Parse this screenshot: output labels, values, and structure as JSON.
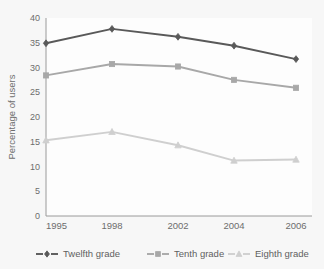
{
  "chart_data": {
    "type": "line",
    "title": "",
    "xlabel": "",
    "ylabel": "Percentage of users",
    "categories": [
      "1995",
      "1998",
      "2002",
      "2004",
      "2006"
    ],
    "x_tick_labels": [
      "1995",
      "1998",
      "2002",
      "2004",
      "2006"
    ],
    "y_tick_labels": [
      "0",
      "5",
      "10",
      "15",
      "20",
      "25",
      "30",
      "35",
      "40"
    ],
    "y_ticks": [
      0,
      5,
      10,
      15,
      20,
      25,
      30,
      35,
      40
    ],
    "ylim": [
      0,
      40
    ],
    "grid": false,
    "legend_position": "bottom",
    "series": [
      {
        "name": "Twelfth grade",
        "marker": "diamond",
        "color": "#595959",
        "values": [
          34.9,
          37.8,
          36.2,
          34.4,
          31.7
        ]
      },
      {
        "name": "Tenth grade",
        "marker": "square",
        "color": "#a8a8a8",
        "values": [
          28.4,
          30.7,
          30.2,
          27.5,
          25.9
        ]
      },
      {
        "name": "Eighth grade",
        "marker": "triangle",
        "color": "#cfcfcf",
        "values": [
          15.3,
          17.0,
          14.3,
          11.2,
          11.4
        ]
      }
    ]
  },
  "axis": {
    "y_title": "Percentage of users"
  },
  "legend": {
    "items": [
      {
        "label": "Twelfth grade"
      },
      {
        "label": "Tenth grade"
      },
      {
        "label": "Eighth grade"
      }
    ]
  },
  "colors": {
    "twelfth": "#595959",
    "tenth": "#a8a8a8",
    "eighth": "#cfcfcf",
    "axis": "#9a9a9a",
    "text": "#6d6d6d",
    "plot_background": "#fdfdfd",
    "page_background": "#f7f7f7"
  }
}
